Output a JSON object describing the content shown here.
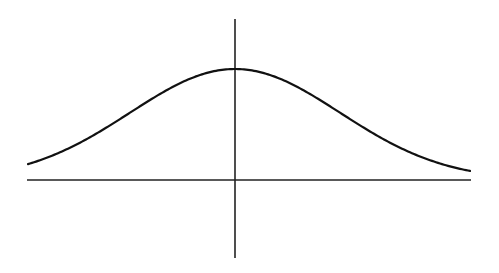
{
  "diagram": {
    "type": "bell-curve",
    "colors": {
      "background": "#ffffff",
      "stroke": "#111111"
    },
    "x_axis": {
      "x1": 27,
      "x2": 471,
      "y": 180
    },
    "y_axis": {
      "x": 235,
      "y1": 19,
      "y2": 258
    },
    "curve": {
      "center_x": 235,
      "peak_y": 69,
      "baseline_y": 180,
      "sigma_px": 105,
      "x_start": 28,
      "x_end": 470
    }
  }
}
